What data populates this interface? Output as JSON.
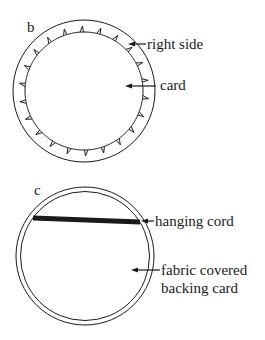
{
  "colors": {
    "ink": "#1a1a1a",
    "background": "#ffffff"
  },
  "figures": [
    {
      "id": "b",
      "panel_label": "b",
      "outer_circle": {
        "cx": 84,
        "cy": 91,
        "r": 71
      },
      "inner_circle": {
        "cx": 84,
        "cy": 91,
        "r": 59,
        "spike_count": 22,
        "spike_length": 6
      },
      "callouts": [
        {
          "text": "right side",
          "arrow_from": [
            146,
            44
          ],
          "arrow_to": [
            128,
            44
          ]
        },
        {
          "text": "card",
          "arrow_from": [
            156,
            86
          ],
          "arrow_to": [
            125,
            86
          ]
        }
      ]
    },
    {
      "id": "c",
      "panel_label": "c",
      "outer_circle": {
        "cx": 85,
        "cy": 86,
        "r": 69
      },
      "inner_circle": {
        "cx": 85,
        "cy": 86,
        "r": 64.5
      },
      "cord": {
        "x1": 33,
        "y1": 48,
        "x2": 140,
        "y2": 52,
        "thickness": 5
      },
      "callouts": [
        {
          "text": "hanging cord",
          "arrow_from": [
            154,
            51
          ],
          "arrow_to": [
            141,
            51
          ]
        },
        {
          "lines": [
            "fabric covered",
            "backing card"
          ],
          "arrow_from": [
            160,
            100
          ],
          "arrow_to": [
            131,
            100
          ]
        }
      ]
    }
  ]
}
